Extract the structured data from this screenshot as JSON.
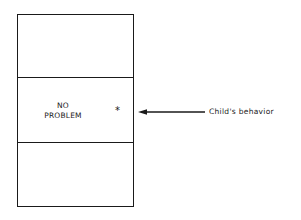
{
  "diagram": {
    "sections": [
      {
        "position": "top",
        "label": ""
      },
      {
        "position": "middle",
        "label_lines": [
          "NO",
          "PROBLEM"
        ]
      },
      {
        "position": "bottom",
        "label": ""
      }
    ],
    "marker": {
      "symbol": "*",
      "section": "middle"
    },
    "pointer": {
      "direction": "left",
      "label": "Child's behavior"
    },
    "colors": {
      "line": "#1a1a1a",
      "background": "#ffffff"
    }
  }
}
